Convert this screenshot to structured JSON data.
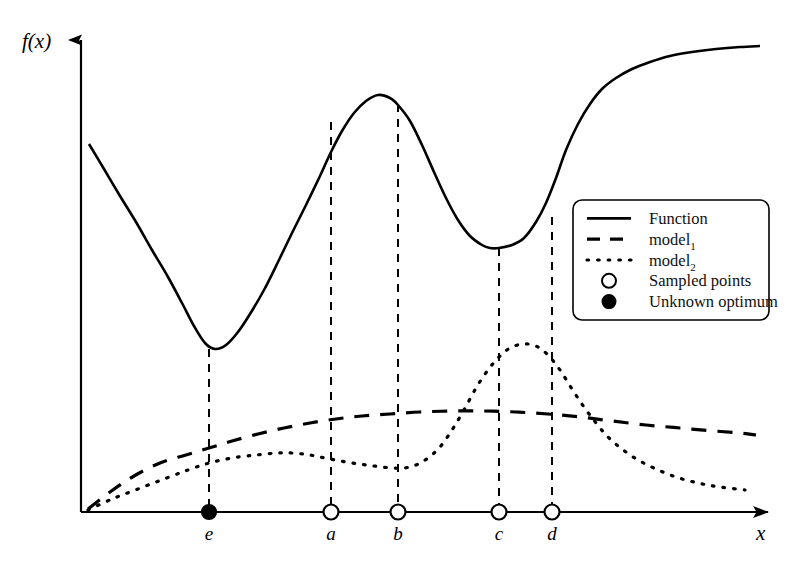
{
  "figure": {
    "background": "#ffffff",
    "ink_color": "#000000",
    "axis": {
      "x_label": "x",
      "y_label": "f(x)",
      "x_axis_y": 512,
      "y_axis_x": 81,
      "x_axis_start": 81,
      "x_axis_end": 778,
      "y_axis_top": 32
    },
    "ticks": [
      {
        "name": "e",
        "label": "e",
        "x": 209,
        "marker": "filled-circle",
        "role": "unknown-optimum",
        "dash_top": 349
      },
      {
        "name": "a",
        "label": "a",
        "x": 331,
        "marker": "open-circle",
        "role": "sampled-point",
        "dash_top": 122
      },
      {
        "name": "b",
        "label": "b",
        "x": 398,
        "marker": "open-circle",
        "role": "sampled-point",
        "dash_top": 104
      },
      {
        "name": "c",
        "label": "c",
        "x": 499,
        "marker": "open-circle",
        "role": "sampled-point",
        "dash_top": 248
      },
      {
        "name": "d",
        "label": "d",
        "x": 552,
        "marker": "open-circle",
        "role": "sampled-point",
        "dash_top": 217
      }
    ],
    "legend": {
      "box": {
        "x": 573,
        "y": 200,
        "width": 196,
        "height": 120,
        "radius": 9
      },
      "entries": [
        {
          "label": "Function",
          "style": "solid",
          "swatch": "line"
        },
        {
          "label": "model",
          "sub": "1",
          "style": "dashed",
          "swatch": "line"
        },
        {
          "label": "model",
          "sub": "2",
          "style": "dotted",
          "swatch": "line"
        },
        {
          "label": "Sampled points",
          "style": "open-circle",
          "swatch": "marker"
        },
        {
          "label": "Unknown optimum",
          "style": "filled-circle",
          "swatch": "marker"
        }
      ]
    }
  },
  "chart_data": {
    "type": "line",
    "title": "",
    "xlabel": "x",
    "ylabel": "f(x)",
    "grid": false,
    "legend_position": "right-middle",
    "axis_pixel_frame": {
      "x0": 81,
      "x1": 778,
      "y0": 512,
      "y1": 32
    },
    "series": [
      {
        "name": "Function",
        "style": "solid",
        "points": [
          [
            89,
            144
          ],
          [
            104,
            169
          ],
          [
            120,
            196
          ],
          [
            136,
            222
          ],
          [
            152,
            250
          ],
          [
            168,
            277
          ],
          [
            182,
            303
          ],
          [
            194,
            326
          ],
          [
            205,
            343
          ],
          [
            215,
            349
          ],
          [
            226,
            345
          ],
          [
            238,
            332
          ],
          [
            250,
            314
          ],
          [
            264,
            290
          ],
          [
            278,
            262
          ],
          [
            292,
            233
          ],
          [
            306,
            205
          ],
          [
            320,
            176
          ],
          [
            331,
            152
          ],
          [
            342,
            131
          ],
          [
            354,
            113
          ],
          [
            366,
            101
          ],
          [
            378,
            95
          ],
          [
            390,
            98
          ],
          [
            398,
            105
          ],
          [
            410,
            121
          ],
          [
            422,
            145
          ],
          [
            434,
            172
          ],
          [
            446,
            198
          ],
          [
            458,
            220
          ],
          [
            470,
            236
          ],
          [
            482,
            245
          ],
          [
            490,
            248
          ],
          [
            499,
            248
          ],
          [
            512,
            245
          ],
          [
            524,
            238
          ],
          [
            536,
            222
          ],
          [
            546,
            203
          ],
          [
            556,
            178
          ],
          [
            566,
            150
          ],
          [
            578,
            124
          ],
          [
            590,
            104
          ],
          [
            602,
            89
          ],
          [
            616,
            78
          ],
          [
            632,
            69
          ],
          [
            650,
            62
          ],
          [
            670,
            56
          ],
          [
            692,
            52
          ],
          [
            716,
            49
          ],
          [
            740,
            47
          ],
          [
            760,
            46
          ]
        ]
      },
      {
        "name": "model1",
        "style": "dashed",
        "points": [
          [
            88,
            509
          ],
          [
            110,
            492
          ],
          [
            134,
            476
          ],
          [
            160,
            463
          ],
          [
            186,
            455
          ],
          [
            209,
            448
          ],
          [
            232,
            441
          ],
          [
            258,
            434
          ],
          [
            284,
            428
          ],
          [
            310,
            423
          ],
          [
            336,
            419
          ],
          [
            362,
            416
          ],
          [
            390,
            414
          ],
          [
            420,
            412
          ],
          [
            452,
            411
          ],
          [
            484,
            411
          ],
          [
            516,
            412
          ],
          [
            548,
            414
          ],
          [
            580,
            417
          ],
          [
            612,
            421
          ],
          [
            646,
            425
          ],
          [
            680,
            428
          ],
          [
            714,
            431
          ],
          [
            740,
            433
          ],
          [
            756,
            435
          ]
        ]
      },
      {
        "name": "model2",
        "style": "dotted",
        "points": [
          [
            88,
            510
          ],
          [
            112,
            499
          ],
          [
            138,
            489
          ],
          [
            164,
            479
          ],
          [
            188,
            470
          ],
          [
            209,
            463
          ],
          [
            232,
            458
          ],
          [
            256,
            455
          ],
          [
            278,
            453
          ],
          [
            292,
            453
          ],
          [
            310,
            455
          ],
          [
            330,
            459
          ],
          [
            352,
            463
          ],
          [
            374,
            466
          ],
          [
            392,
            468
          ],
          [
            404,
            468
          ],
          [
            416,
            465
          ],
          [
            428,
            458
          ],
          [
            440,
            447
          ],
          [
            452,
            430
          ],
          [
            464,
            410
          ],
          [
            476,
            388
          ],
          [
            488,
            370
          ],
          [
            499,
            357
          ],
          [
            510,
            348
          ],
          [
            523,
            344
          ],
          [
            536,
            346
          ],
          [
            548,
            355
          ],
          [
            560,
            370
          ],
          [
            572,
            389
          ],
          [
            584,
            407
          ],
          [
            596,
            423
          ],
          [
            608,
            437
          ],
          [
            622,
            449
          ],
          [
            638,
            460
          ],
          [
            656,
            469
          ],
          [
            676,
            477
          ],
          [
            698,
            483
          ],
          [
            720,
            487
          ],
          [
            745,
            490
          ]
        ]
      }
    ]
  }
}
